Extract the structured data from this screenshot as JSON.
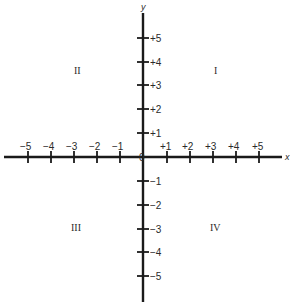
{
  "diagram": {
    "type": "cartesian-coordinate-plane",
    "axes": {
      "x": {
        "label": "x",
        "ticks": [
          "−5",
          "−4",
          "−3",
          "−2",
          "−1",
          "+1",
          "+2",
          "+3",
          "+4",
          "+5"
        ]
      },
      "y": {
        "label": "y",
        "ticks": [
          "+5",
          "+4",
          "+3",
          "+2",
          "+1",
          "−1",
          "−2",
          "−3",
          "−4",
          "−5"
        ]
      },
      "origin_label": "0"
    },
    "quadrants": [
      {
        "id": "I",
        "label": "I"
      },
      {
        "id": "II",
        "label": "II"
      },
      {
        "id": "III",
        "label": "III"
      },
      {
        "id": "IV",
        "label": "IV"
      }
    ],
    "colors": {
      "axis": "#1a1a1a",
      "text": "#2a2a2a",
      "background": "#ffffff"
    }
  }
}
